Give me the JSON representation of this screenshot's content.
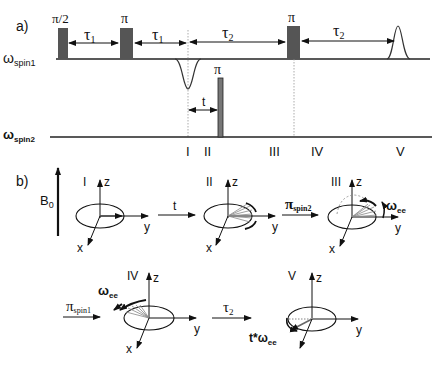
{
  "panel_a": {
    "label": "a)",
    "channels": {
      "spin1": {
        "symbol": "ω",
        "subscript": "spin1"
      },
      "spin2": {
        "symbol": "ω",
        "subscript": "spin2"
      }
    },
    "pulses": {
      "p1": "π/2",
      "p2": "π",
      "p3": "π",
      "p_spin2": "π"
    },
    "delays": {
      "tau1_a": {
        "sym": "τ",
        "sub": "1"
      },
      "tau1_b": {
        "sym": "τ",
        "sub": "1"
      },
      "tau2_a": {
        "sym": "τ",
        "sub": "2"
      },
      "tau2_b": {
        "sym": "τ",
        "sub": "2"
      },
      "t": "t"
    },
    "timepoints": [
      "I",
      "II",
      "III",
      "IV",
      "V"
    ]
  },
  "panel_b": {
    "label": "b)",
    "field": {
      "sym": "B",
      "sub": "0"
    },
    "frames": [
      {
        "id": "I",
        "z": "z",
        "y": "y",
        "x": "x"
      },
      {
        "id": "II",
        "z": "z",
        "y": "y",
        "x": "x"
      },
      {
        "id": "III",
        "z": "z",
        "y": "y",
        "x": "x",
        "annotation": {
          "sym": "ω",
          "sub": "ee"
        }
      },
      {
        "id": "IV",
        "z": "z",
        "y": "y",
        "x": "x",
        "annotation": {
          "sym": "ω",
          "sub": "ee"
        }
      },
      {
        "id": "V",
        "z": "z",
        "y": "y",
        "annotation": {
          "pre": "t*",
          "sym": "ω",
          "sub": "ee"
        }
      }
    ],
    "transitions": [
      {
        "label": "t"
      },
      {
        "sym": "π",
        "sub": "spin2"
      },
      {
        "sym": "π",
        "sub": "spin1"
      },
      {
        "sym": "τ",
        "sub": "2"
      }
    ]
  }
}
